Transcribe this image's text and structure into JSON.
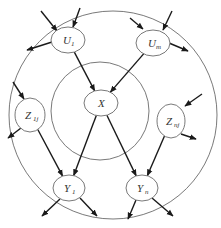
{
  "diagram": {
    "title": "",
    "rings": [
      {
        "id": "outer",
        "cx": 113,
        "cy": 115,
        "r": 104
      },
      {
        "id": "inner",
        "cx": 100,
        "cy": 111,
        "r": 49
      }
    ],
    "nodes": [
      {
        "id": "U1",
        "label": "U",
        "sub": "1",
        "cx": 68,
        "cy": 40,
        "rx": 17,
        "ry": 13
      },
      {
        "id": "Um",
        "label": "U",
        "sub": "m",
        "cx": 153,
        "cy": 43,
        "rx": 17,
        "ry": 13
      },
      {
        "id": "X",
        "label": "X",
        "sub": "",
        "cx": 101,
        "cy": 103,
        "rx": 17,
        "ry": 13
      },
      {
        "id": "Z1j",
        "label": "Z",
        "sub": "1j",
        "cx": 30,
        "cy": 115,
        "rx": 15,
        "ry": 17
      },
      {
        "id": "Znj",
        "label": "Z",
        "sub": "nj",
        "cx": 171,
        "cy": 121,
        "rx": 14,
        "ry": 17
      },
      {
        "id": "Y1",
        "label": "Y",
        "sub": "1",
        "cx": 69,
        "cy": 188,
        "rx": 16,
        "ry": 13
      },
      {
        "id": "Yn",
        "label": "Y",
        "sub": "n",
        "cx": 142,
        "cy": 188,
        "rx": 16,
        "ry": 13
      }
    ],
    "edges": [
      {
        "from": "U1",
        "to": "X"
      },
      {
        "from": "Um",
        "to": "X"
      },
      {
        "from": "X",
        "to": "Y1"
      },
      {
        "from": "X",
        "to": "Yn"
      },
      {
        "from": "Z1j",
        "to": "Y1"
      },
      {
        "from": "Znj",
        "to": "Yn"
      }
    ],
    "external_arrows": [
      {
        "x1": 41,
        "y1": 11,
        "x2": 57,
        "y2": 31,
        "dir": "in",
        "target": "U1"
      },
      {
        "x1": 80,
        "y1": 8,
        "x2": 73,
        "y2": 27,
        "dir": "in",
        "target": "U1"
      },
      {
        "x1": 52,
        "y1": 42,
        "x2": 27,
        "y2": 50,
        "dir": "out",
        "source": "U1"
      },
      {
        "x1": 130,
        "y1": 18,
        "x2": 143,
        "y2": 29,
        "dir": "in",
        "target": "Um"
      },
      {
        "x1": 172,
        "y1": 11,
        "x2": 163,
        "y2": 30,
        "dir": "in",
        "target": "Um"
      },
      {
        "x1": 169,
        "y1": 43,
        "x2": 188,
        "y2": 51,
        "dir": "out",
        "source": "Um"
      },
      {
        "x1": 13,
        "y1": 82,
        "x2": 24,
        "y2": 99,
        "dir": "in",
        "target": "Z1j"
      },
      {
        "x1": 21,
        "y1": 128,
        "x2": 8,
        "y2": 138,
        "dir": "out",
        "source": "Z1j"
      },
      {
        "x1": 202,
        "y1": 94,
        "x2": 185,
        "y2": 106,
        "dir": "in",
        "target": "Znj"
      },
      {
        "x1": 181,
        "y1": 134,
        "x2": 196,
        "y2": 139,
        "dir": "out",
        "source": "Znj"
      },
      {
        "x1": 60,
        "y1": 199,
        "x2": 42,
        "y2": 216,
        "dir": "out",
        "source": "Y1"
      },
      {
        "x1": 80,
        "y1": 198,
        "x2": 97,
        "y2": 216,
        "dir": "out",
        "source": "Y1"
      },
      {
        "x1": 136,
        "y1": 200,
        "x2": 128,
        "y2": 219,
        "dir": "out",
        "source": "Yn"
      },
      {
        "x1": 152,
        "y1": 198,
        "x2": 173,
        "y2": 216,
        "dir": "out",
        "source": "Yn"
      }
    ],
    "colors": {
      "stroke": "#6a6a6a",
      "arrow": "#1a1a1a",
      "text": "#333333",
      "background": "#ffffff"
    }
  }
}
